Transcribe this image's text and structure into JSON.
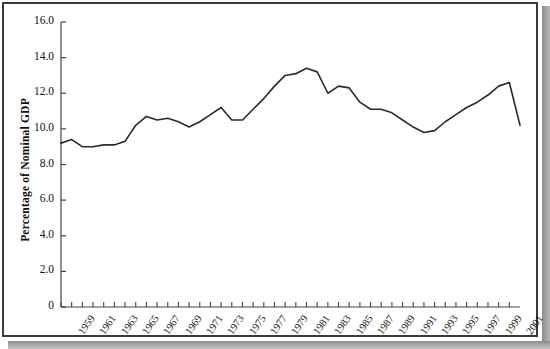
{
  "figure": {
    "background_color": "#ffffff",
    "frame_color": "#3a3a3a",
    "line_color": "#2b2b2b"
  },
  "chart_data": {
    "type": "line",
    "title": "",
    "xlabel": "",
    "ylabel": "Percentage of Nominal GDP",
    "ylim": [
      0,
      16.0
    ],
    "xlim": [
      1959,
      2002
    ],
    "grid": false,
    "legend": "none",
    "ytick_labels": [
      "0",
      "2.0",
      "4.0",
      "6.0",
      "8.0",
      "10.0",
      "12.0",
      "14.0",
      "16.0"
    ],
    "ytick_values": [
      0,
      2.0,
      4.0,
      6.0,
      8.0,
      10.0,
      12.0,
      14.0,
      16.0
    ],
    "xtick_labels": [
      "1959",
      "1961",
      "1963",
      "1965",
      "1967",
      "1969",
      "1971",
      "1973",
      "1975",
      "1977",
      "1979",
      "1981",
      "1983",
      "1985",
      "1987",
      "1989",
      "1991",
      "1993",
      "1995",
      "1997",
      "1999",
      "2001"
    ],
    "xtick_values": [
      1959,
      1961,
      1963,
      1965,
      1967,
      1969,
      1971,
      1973,
      1975,
      1977,
      1979,
      1981,
      1983,
      1985,
      1987,
      1989,
      1991,
      1993,
      1995,
      1997,
      1999,
      2001
    ],
    "x": [
      1959,
      1960,
      1961,
      1962,
      1963,
      1964,
      1965,
      1966,
      1967,
      1968,
      1969,
      1970,
      1971,
      1972,
      1973,
      1974,
      1975,
      1976,
      1977,
      1978,
      1979,
      1980,
      1981,
      1982,
      1983,
      1984,
      1985,
      1986,
      1987,
      1988,
      1989,
      1990,
      1991,
      1992,
      1993,
      1994,
      1995,
      1996,
      1997,
      1998,
      1999,
      2000,
      2001,
      2002
    ],
    "values": [
      9.2,
      9.4,
      9.0,
      9.0,
      9.1,
      9.1,
      9.3,
      10.2,
      10.7,
      10.5,
      10.6,
      10.4,
      10.1,
      10.4,
      10.8,
      11.2,
      10.5,
      10.5,
      11.1,
      11.7,
      12.4,
      13.0,
      13.1,
      13.4,
      13.2,
      12.0,
      12.4,
      12.3,
      11.5,
      11.1,
      11.1,
      10.9,
      10.5,
      10.1,
      9.8,
      9.9,
      10.4,
      10.8,
      11.2,
      11.5,
      11.9,
      12.4,
      12.6,
      10.2
    ],
    "series": [
      {
        "name": "Percentage of Nominal GDP",
        "values": [
          9.2,
          9.4,
          9.0,
          9.0,
          9.1,
          9.1,
          9.3,
          10.2,
          10.7,
          10.5,
          10.6,
          10.4,
          10.1,
          10.4,
          10.8,
          11.2,
          10.5,
          10.5,
          11.1,
          11.7,
          12.4,
          13.0,
          13.1,
          13.4,
          13.2,
          12.0,
          12.4,
          12.3,
          11.5,
          11.1,
          11.1,
          10.9,
          10.5,
          10.1,
          9.8,
          9.9,
          10.4,
          10.8,
          11.2,
          11.5,
          11.9,
          12.4,
          12.6,
          10.2
        ]
      }
    ]
  }
}
